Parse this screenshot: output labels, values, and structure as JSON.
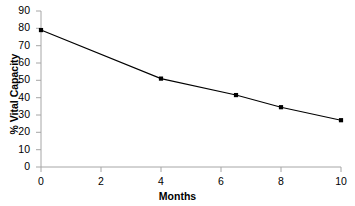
{
  "chart_data": {
    "type": "line",
    "title": "",
    "xlabel": "Months",
    "ylabel": "% Vital Capacity",
    "xlim": [
      0,
      10
    ],
    "ylim": [
      0,
      90
    ],
    "xticks": [
      0,
      2,
      4,
      6,
      8,
      10
    ],
    "yticks": [
      0,
      10,
      20,
      30,
      40,
      50,
      60,
      70,
      80,
      90
    ],
    "xtick_labels": [
      "0",
      "2",
      "4",
      "6",
      "8",
      "10"
    ],
    "ytick_labels": [
      "0",
      "10",
      "20",
      "30",
      "40",
      "50",
      "60",
      "70",
      "80",
      "90"
    ],
    "grid": false,
    "legend": null,
    "marker": "square",
    "line_color": "#000000",
    "marker_color": "#000000",
    "axis_color": "#a6a6a6",
    "background_color": "#ffffff",
    "series": [
      {
        "name": "% Vital Capacity",
        "x": [
          0,
          4,
          6.5,
          8,
          10
        ],
        "y": [
          79,
          51,
          41.5,
          34.5,
          27
        ]
      }
    ]
  }
}
